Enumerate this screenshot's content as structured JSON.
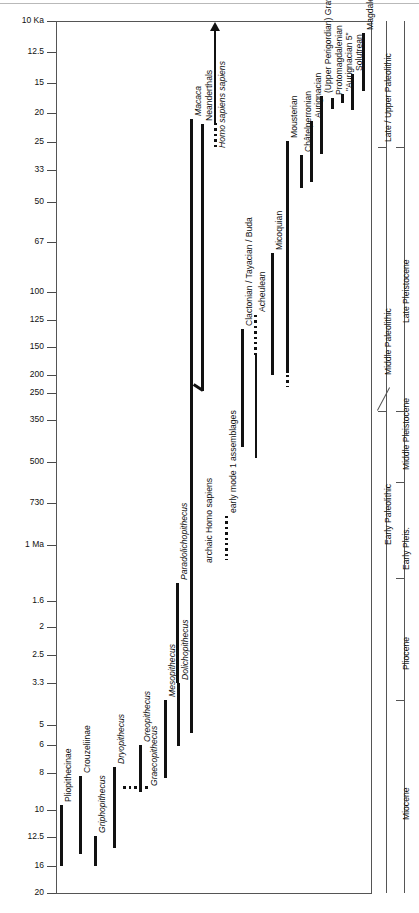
{
  "chart_data": {
    "type": "range-bar-timeline",
    "title": "",
    "ylabel": "Age",
    "yunit": "Ka / Ma before present",
    "axis_direction": "older downward (non-linear scale)",
    "ytick_labels": [
      "10 Ka",
      "12.5",
      "15",
      "20",
      "25",
      "33",
      "50",
      "67",
      "100",
      "125",
      "150",
      "200",
      "250",
      "350",
      "500",
      "730",
      "1 Ma",
      "1.6",
      "2",
      "2.5",
      "3.3",
      "5",
      "6",
      "8",
      "10",
      "12.5",
      "16",
      "20"
    ],
    "grid": false,
    "legend": null,
    "taxa": [
      {
        "label": "Pliopithecinae",
        "italic": false,
        "style": "solid",
        "from": "9.7",
        "to": "16"
      },
      {
        "label": "Crouzeliinae",
        "italic": false,
        "style": "solid",
        "from": "8.4",
        "to": "14.5"
      },
      {
        "label": "Griphopithecus",
        "italic": true,
        "style": "solid",
        "from": "12.3",
        "to": "16"
      },
      {
        "label": "Dryopithecus",
        "italic": true,
        "style": "solid",
        "from": "7.7",
        "to": "13.5"
      },
      {
        "label": "Graecopithecus",
        "italic": true,
        "style": "dotted",
        "from": "8.2",
        "to": "10.2"
      },
      {
        "label": "Oreopithecus",
        "italic": true,
        "style": "solid",
        "from": "6.3",
        "to": "8.6"
      },
      {
        "label": "Mesopithecus",
        "italic": true,
        "style": "solid",
        "from": "4.3",
        "to": "8.3"
      },
      {
        "label": "Dolichopithecus",
        "italic": true,
        "style": "solid",
        "from": "3.3",
        "to": "6.6"
      },
      {
        "label": "Macaca",
        "italic": true,
        "style": "solid",
        "from": "0.1",
        "to": "5.4"
      },
      {
        "label": "Paradolichopithecus",
        "italic": true,
        "style": "solid",
        "from": "1.3",
        "to": "3.1"
      },
      {
        "label": "archaic Homo sapiens",
        "italic": "partial",
        "style": "bent",
        "from": "60",
        "to": "730"
      },
      {
        "label": "Neanderthals",
        "italic": false,
        "style": "solid",
        "from": "33",
        "to": "250"
      },
      {
        "label": "Homo sapiens sapiens",
        "italic": true,
        "style": "arrow",
        "from": "present",
        "to": "40"
      }
    ],
    "industries": [
      {
        "label": "early mode 1 assemblages",
        "style": "dotted",
        "from": "500",
        "to": "1000"
      },
      {
        "label": "Clactonian / Tayacian / Buda",
        "style": "solid",
        "from": "130",
        "to": "500"
      },
      {
        "label": "Acheulean",
        "style": "dotted-top-solid",
        "from": "130",
        "to": "600"
      },
      {
        "label": "Micoquian",
        "style": "solid",
        "from": "60",
        "to": "200"
      },
      {
        "label": "Mousterian",
        "style": "solid",
        "from": "33",
        "to": "250"
      },
      {
        "label": "Châtelperronian",
        "style": "solid",
        "from": "30",
        "to": "36"
      },
      {
        "label": "Aurignacian",
        "style": "solid",
        "from": "25",
        "to": "36"
      },
      {
        "label": "(Upper Perigordian) Gravettian",
        "style": "solid",
        "from": "20",
        "to": "29"
      },
      {
        "label": "Protomagdalenian",
        "style": "solid",
        "from": "19",
        "to": "21"
      },
      {
        "label": "\"Aurignacian 5\"",
        "style": "solid",
        "from": "18",
        "to": "19.5"
      },
      {
        "label": "Solutrean",
        "style": "solid",
        "from": "16",
        "to": "20"
      },
      {
        "label": "Magdalenian",
        "style": "solid",
        "from": "10",
        "to": "17"
      }
    ],
    "paleolithic_column": [
      {
        "label": "Late / Upper Paleolithic"
      },
      {
        "label": "Middle Paleolithic"
      },
      {
        "label": "Early Paleolithic"
      }
    ],
    "epoch_column": [
      {
        "label": "Late Pleistocene"
      },
      {
        "label": "Middle Pleistocene"
      },
      {
        "label": "Early Pleis."
      },
      {
        "label": "Pliocene"
      },
      {
        "label": "Miocene"
      }
    ]
  },
  "axis": {
    "ticks": [
      {
        "label": "10 Ka",
        "y": 21
      },
      {
        "label": "12.5",
        "y": 52
      },
      {
        "label": "15",
        "y": 83
      },
      {
        "label": "20",
        "y": 113
      },
      {
        "label": "25",
        "y": 142
      },
      {
        "label": "33",
        "y": 170
      },
      {
        "label": "50",
        "y": 202
      },
      {
        "label": "67",
        "y": 242
      },
      {
        "label": "100",
        "y": 292
      },
      {
        "label": "125",
        "y": 320
      },
      {
        "label": "150",
        "y": 347
      },
      {
        "label": "200",
        "y": 375
      },
      {
        "label": "250",
        "y": 393
      },
      {
        "label": "350",
        "y": 420
      },
      {
        "label": "500",
        "y": 462
      },
      {
        "label": "730",
        "y": 503
      },
      {
        "label": "1 Ma",
        "y": 545
      },
      {
        "label": "1.6",
        "y": 601
      },
      {
        "label": "2",
        "y": 627
      },
      {
        "label": "2.5",
        "y": 655
      },
      {
        "label": "3.3",
        "y": 683
      },
      {
        "label": "5",
        "y": 725
      },
      {
        "label": "6",
        "y": 745
      },
      {
        "label": "8",
        "y": 773
      },
      {
        "label": "10",
        "y": 810
      },
      {
        "label": "12.5",
        "y": 837
      },
      {
        "label": "16",
        "y": 866
      },
      {
        "label": "20",
        "y": 893
      }
    ]
  },
  "labels": {
    "t0": "Pliopithecinae",
    "t1": "Crouzeliinae",
    "t2": "Griphopithecus",
    "t3": "Dryopithecus",
    "t4": "Graecopithecus",
    "t5": "Oreopithecus",
    "t6": "Mesopithecus",
    "t7": "Dolichopithecus",
    "t8": "Macaca",
    "t9": "Paradolichopithecus",
    "t10": "archaic Homo sapiens",
    "t11": "Neanderthals",
    "t12": "Homo sapiens sapiens",
    "i0": "early mode 1 assemblages",
    "i1": "Clactonian / Tayacian / Buda",
    "i2": "Acheulean",
    "i3": "Micoquian",
    "i4": "Mousterian",
    "i5": "Châtelperronian",
    "i6": "Aurignacian",
    "i7": "(Upper Perigordian) Gravettian",
    "i8": "Protomagdalenian",
    "i9": "\"Aurignacian 5\"",
    "i10": "Solutrean",
    "i11": "Magdalenian",
    "p0": "Late / Upper Paleolithic",
    "p1": "Middle Paleolithic",
    "p2": "Early Paleolithic",
    "e0": "Late Pleistocene",
    "e1": "Middle Pleistocene",
    "e2": "Early Pleis.",
    "e3": "Pliocene",
    "e4": "Miocene"
  }
}
